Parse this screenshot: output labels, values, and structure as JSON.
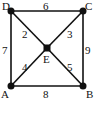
{
  "graph": {
    "nodes": [
      {
        "id": "D",
        "label": "D",
        "x": 11,
        "y": 11,
        "lx": 2,
        "ly": 10,
        "shape": "circle"
      },
      {
        "id": "C",
        "label": "C",
        "x": 83,
        "y": 11,
        "lx": 85,
        "ly": 10,
        "shape": "circle"
      },
      {
        "id": "A",
        "label": "A",
        "x": 11,
        "y": 86,
        "lx": 1,
        "ly": 98,
        "shape": "circle"
      },
      {
        "id": "B",
        "label": "B",
        "x": 83,
        "y": 86,
        "lx": 86,
        "ly": 98,
        "shape": "circle"
      },
      {
        "id": "E",
        "label": "E",
        "x": 47,
        "y": 48,
        "lx": 43,
        "ly": 63,
        "shape": "square"
      }
    ],
    "edges": [
      {
        "from": "D",
        "to": "C",
        "weight": "6",
        "lx": 43,
        "ly": 10
      },
      {
        "from": "D",
        "to": "A",
        "weight": "7",
        "lx": 2,
        "ly": 54
      },
      {
        "from": "C",
        "to": "B",
        "weight": "9",
        "lx": 85,
        "ly": 54
      },
      {
        "from": "A",
        "to": "B",
        "weight": "8",
        "lx": 43,
        "ly": 98
      },
      {
        "from": "D",
        "to": "E",
        "weight": "2",
        "lx": 22,
        "ly": 38
      },
      {
        "from": "C",
        "to": "E",
        "weight": "3",
        "lx": 67,
        "ly": 38
      },
      {
        "from": "A",
        "to": "E",
        "weight": "4",
        "lx": 22,
        "ly": 71
      },
      {
        "from": "B",
        "to": "E",
        "weight": "5",
        "lx": 67,
        "ly": 71
      }
    ]
  }
}
